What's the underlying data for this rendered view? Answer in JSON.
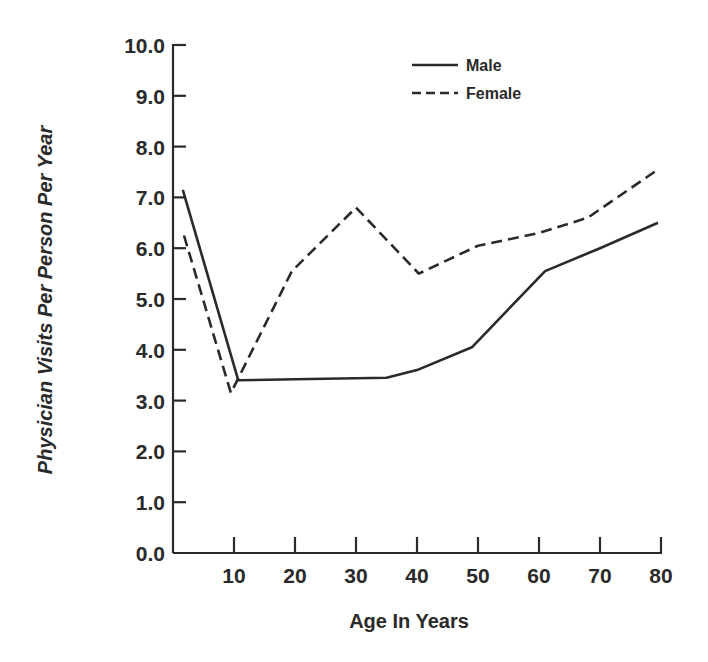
{
  "chart_data": {
    "type": "line",
    "title": "",
    "xlabel": "Age In Years",
    "ylabel": "Physician Visits Per Person Per Year",
    "xlim": [
      0,
      80
    ],
    "ylim": [
      0,
      10
    ],
    "x_ticks": [
      10,
      20,
      30,
      40,
      50,
      60,
      70,
      80
    ],
    "x_tick_labels": [
      "10",
      "20",
      "30",
      "40",
      "50",
      "60",
      "70",
      "80"
    ],
    "y_ticks": [
      0,
      1,
      2,
      3,
      4,
      5,
      6,
      7,
      8,
      9,
      10
    ],
    "y_tick_labels": [
      "0.0",
      "1.0",
      "2.0",
      "3.0",
      "4.0",
      "5.0",
      "6.0",
      "7.0",
      "8.0",
      "9.0",
      "10.0"
    ],
    "grid": false,
    "legend_position": "upper right",
    "series": [
      {
        "name": "Male",
        "style": "solid",
        "color": "#2a2a2a",
        "x": [
          1.6,
          10.7,
          20,
          30,
          35,
          40,
          49,
          61,
          70,
          79.5
        ],
        "y": [
          7.15,
          3.4,
          3.42,
          3.44,
          3.45,
          3.6,
          4.05,
          5.55,
          6.0,
          6.5
        ]
      },
      {
        "name": "Female",
        "style": "dashed",
        "color": "#2a2a2a",
        "x": [
          1.8,
          9.5,
          19.5,
          30,
          40.3,
          50,
          60,
          68,
          79.5
        ],
        "y": [
          6.25,
          3.15,
          5.55,
          6.8,
          5.5,
          6.05,
          6.3,
          6.6,
          7.55
        ]
      }
    ]
  },
  "legend": {
    "items": [
      {
        "label": "Male",
        "style": "solid"
      },
      {
        "label": "Female",
        "style": "dashed"
      }
    ]
  },
  "axes": {
    "x_title": "Age In Years",
    "y_title": "Physician Visits Per Person Per Year"
  }
}
